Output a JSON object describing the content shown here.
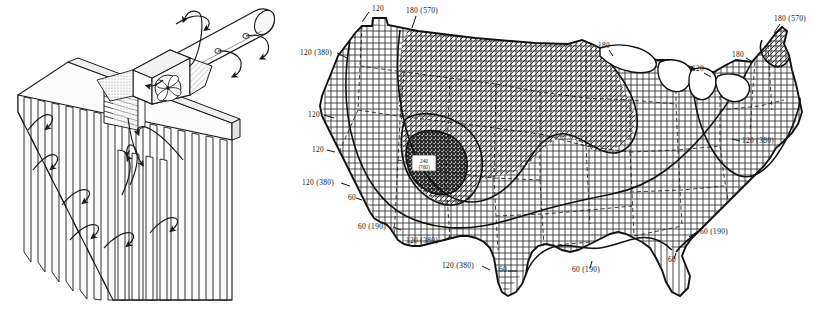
{
  "figure": {
    "panels": [
      {
        "id": "illustration",
        "name": "duct-fan-wall-illustration",
        "description": "Isometric line drawing of a wall of vertical slats with a cylindrical duct, square fan housing and curved airflow arrows"
      },
      {
        "id": "map",
        "name": "united-states-contour-map",
        "description": "Outline map of the contiguous United States with state borders and four hatched zones separated by heavy isolines"
      }
    ]
  },
  "illustration": {
    "elements": [
      {
        "name": "slat-wall",
        "label": ""
      },
      {
        "name": "cylindrical-duct",
        "label": ""
      },
      {
        "name": "fan-housing",
        "label": ""
      },
      {
        "name": "fan-blades",
        "label": ""
      },
      {
        "name": "louver-grille",
        "label": ""
      },
      {
        "name": "airflow-arrow",
        "label": ""
      }
    ],
    "counts": {
      "wall_slats_front": 14,
      "wall_slats_lower": 11,
      "duct_outlets": 4,
      "airflow_arrows": 13,
      "fan_blades": 4
    }
  },
  "map": {
    "name": "contiguous-us-isoline-map",
    "units_note": "",
    "zones": [
      {
        "name": "zone-vertical-hatch",
        "pattern": "vertical-lines",
        "value": "60"
      },
      {
        "name": "zone-grid-hatch",
        "pattern": "square-grid",
        "value": "120"
      },
      {
        "name": "zone-diagonal-hatch",
        "pattern": "diagonal-cross-hatch",
        "value": "180"
      },
      {
        "name": "zone-dense-hatch",
        "pattern": "dense-dark-hatch",
        "value": "240"
      }
    ],
    "labels": [
      {
        "id": "l01",
        "text": "120",
        "x": 72,
        "y": 11,
        "leader": {
          "x1": 69,
          "y1": 12,
          "x2": 62,
          "y2": 22
        }
      },
      {
        "id": "l02",
        "text": "180 (570)",
        "x": 106,
        "y": 13,
        "leader": {
          "x1": 116,
          "y1": 16,
          "x2": 112,
          "y2": 28
        }
      },
      {
        "id": "l03",
        "text": "120 (380)",
        "x": 0,
        "y": 55,
        "leader": {
          "x1": 37,
          "y1": 53,
          "x2": 47,
          "y2": 58
        }
      },
      {
        "id": "l04",
        "text": "120",
        "x": 8,
        "y": 117,
        "leader": {
          "x1": 24,
          "y1": 115,
          "x2": 34,
          "y2": 118
        }
      },
      {
        "id": "l05",
        "text": "120",
        "x": 12,
        "y": 152,
        "leader": {
          "x1": 27,
          "y1": 150,
          "x2": 35,
          "y2": 152
        }
      },
      {
        "id": "l06",
        "text": "120 (380)",
        "x": 2,
        "y": 185,
        "leader": {
          "x1": 41,
          "y1": 183,
          "x2": 50,
          "y2": 186
        }
      },
      {
        "id": "l07",
        "text": "60",
        "x": 48,
        "y": 200,
        "leader": {
          "x1": 56,
          "y1": 198,
          "x2": 62,
          "y2": 200
        }
      },
      {
        "id": "l08",
        "text": "60 (190)",
        "x": 58,
        "y": 229,
        "leader": {
          "x1": 93,
          "y1": 227,
          "x2": 101,
          "y2": 230
        }
      },
      {
        "id": "l09",
        "text": "120 (380)",
        "x": 106,
        "y": 243,
        "leader": {
          "x1": 144,
          "y1": 241,
          "x2": 150,
          "y2": 236
        }
      },
      {
        "id": "l10",
        "text": "120 (380)",
        "x": 142,
        "y": 268,
        "leader": {
          "x1": 182,
          "y1": 266,
          "x2": 190,
          "y2": 270
        }
      },
      {
        "id": "l11",
        "text": "60",
        "x": 199,
        "y": 272,
        "leader": {
          "x1": 208,
          "y1": 271,
          "x2": 217,
          "y2": 271
        }
      },
      {
        "id": "l12",
        "text": "60 (190)",
        "x": 272,
        "y": 272,
        "leader": {
          "x1": 290,
          "y1": 268,
          "x2": 292,
          "y2": 261
        }
      },
      {
        "id": "l13",
        "text": "60",
        "x": 368,
        "y": 262,
        "leader": {
          "x1": 374,
          "y1": 259,
          "x2": 376,
          "y2": 253
        }
      },
      {
        "id": "l14",
        "text": "60 (190)",
        "x": 400,
        "y": 234,
        "leader": {
          "x1": 397,
          "y1": 232,
          "x2": 389,
          "y2": 237
        }
      },
      {
        "id": "l15",
        "text": "180",
        "x": 298,
        "y": 48,
        "leader": {
          "x1": 309,
          "y1": 50,
          "x2": 313,
          "y2": 56
        }
      },
      {
        "id": "l16",
        "text": "120",
        "x": 392,
        "y": 71,
        "leader": {
          "x1": 404,
          "y1": 73,
          "x2": 411,
          "y2": 77
        }
      },
      {
        "id": "l17",
        "text": "180",
        "x": 432,
        "y": 57,
        "leader": {
          "x1": 446,
          "y1": 58,
          "x2": 453,
          "y2": 62
        }
      },
      {
        "id": "l18",
        "text": "180 (570)",
        "x": 474,
        "y": 21,
        "leader": {
          "x1": 480,
          "y1": 24,
          "x2": 474,
          "y2": 33
        }
      },
      {
        "id": "l19",
        "text": "120 (380)",
        "x": 442,
        "y": 143,
        "leader": {
          "x1": 440,
          "y1": 141,
          "x2": 432,
          "y2": 139
        }
      }
    ],
    "callout_box": {
      "name": "peak-value-callout",
      "line1": "240",
      "line2": "(760)",
      "x": 112,
      "y": 155
    }
  }
}
